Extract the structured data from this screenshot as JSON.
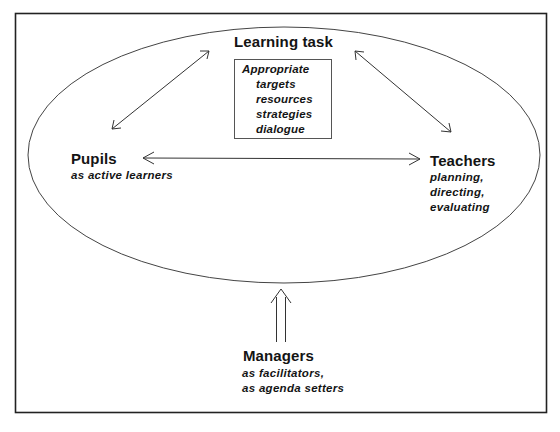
{
  "diagram": {
    "learning_task": {
      "title": "Learning task",
      "box_lines": [
        "Appropriate",
        "targets",
        "resources",
        "strategies",
        "dialogue"
      ]
    },
    "pupils": {
      "title": "Pupils",
      "subtitle": "as active learners"
    },
    "teachers": {
      "title": "Teachers",
      "subtitle_lines": [
        "planning,",
        "directing,",
        "evaluating"
      ]
    },
    "managers": {
      "title": "Managers",
      "subtitle_lines": [
        "as facilitators,",
        "as agenda setters"
      ]
    },
    "connections": [
      {
        "from": "Pupils",
        "to": "Learning task",
        "type": "double-headed"
      },
      {
        "from": "Teachers",
        "to": "Learning task",
        "type": "double-headed"
      },
      {
        "from": "Pupils",
        "to": "Teachers",
        "type": "double-headed"
      },
      {
        "from": "Managers",
        "to": "ellipse",
        "type": "double-line-arrow-up"
      }
    ],
    "colors": {
      "line": "#333333",
      "text": "#141414",
      "background": "#ffffff"
    }
  }
}
